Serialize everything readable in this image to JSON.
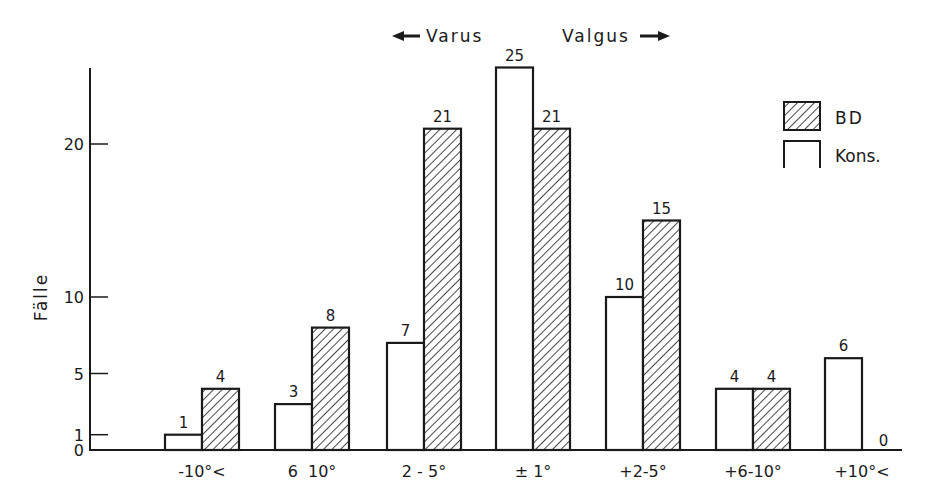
{
  "chart_data": {
    "type": "bar",
    "title": "",
    "annotations": {
      "left_arrow_label": "Varus",
      "right_arrow_label": "Valgus"
    },
    "xlabel": "",
    "ylabel": "Fälle",
    "ylim": [
      0,
      27
    ],
    "yticks": [
      0,
      1,
      5,
      10,
      20
    ],
    "ytick_labels": [
      "0",
      "1",
      "5",
      "10",
      "20"
    ],
    "grid": false,
    "legend_position": "upper right",
    "categories": [
      "-10°<",
      "6  10°",
      "2 - 5°",
      "± 1°",
      "+2-5°",
      "+6-10°",
      "+10°<"
    ],
    "series": [
      {
        "name": "Kons.",
        "pattern": "open",
        "values": [
          1,
          3,
          7,
          25,
          10,
          4,
          6
        ]
      },
      {
        "name": "BD",
        "pattern": "hatched",
        "values": [
          4,
          8,
          21,
          21,
          15,
          4,
          0
        ]
      }
    ]
  },
  "legend": {
    "items": [
      {
        "label": "BD",
        "pattern": "hatched"
      },
      {
        "label": "Kons.",
        "pattern": "open"
      }
    ]
  },
  "colors": {
    "ink": "#1a1a1a",
    "background": "#ffffff"
  }
}
